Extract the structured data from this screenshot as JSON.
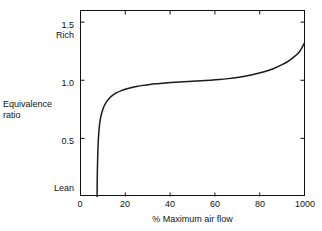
{
  "chart_data": {
    "type": "line",
    "title": "",
    "xlabel": "% Maximum air flow",
    "ylabel": "Equivalence ratio",
    "xlim": [
      0,
      100
    ],
    "ylim": [
      0,
      1.6
    ],
    "grid": false,
    "legend": null,
    "x_ticks": [
      {
        "value": 0,
        "label": "0"
      },
      {
        "value": 20,
        "label": "20"
      },
      {
        "value": 40,
        "label": "40"
      },
      {
        "value": 60,
        "label": "60"
      },
      {
        "value": 80,
        "label": "80"
      },
      {
        "value": 100,
        "label": "1000"
      }
    ],
    "y_ticks": [
      {
        "value": 0.5,
        "label": "0.5"
      },
      {
        "value": 1.0,
        "label": "1.0"
      },
      {
        "value": 1.5,
        "label": "1.5"
      }
    ],
    "annotations": [
      {
        "name": "rich",
        "text": "Rich",
        "at_y": 1.42
      },
      {
        "name": "lean",
        "text": "Lean",
        "at_y": 0.1
      }
    ],
    "series": [
      {
        "name": "equivalence-ratio-curve",
        "color": "#1a1a1a",
        "x": [
          7.4,
          7.5,
          7.7,
          8.0,
          8.4,
          8.9,
          9.5,
          10.2,
          11.0,
          12.0,
          13.2,
          14.6,
          16.2,
          18.0,
          20.0,
          22.5,
          25.0,
          28.0,
          31.0,
          34.0,
          38.0,
          42.0,
          46.0,
          50.0,
          54.0,
          58.0,
          62.0,
          66.0,
          70.0,
          74.0,
          78.0,
          82.0,
          86.0,
          90.0,
          93.0,
          96.0,
          98.0,
          100.0
        ],
        "y": [
          0.0,
          0.18,
          0.36,
          0.5,
          0.6,
          0.67,
          0.72,
          0.762,
          0.795,
          0.825,
          0.852,
          0.874,
          0.893,
          0.909,
          0.922,
          0.935,
          0.946,
          0.956,
          0.964,
          0.97,
          0.977,
          0.982,
          0.987,
          0.991,
          0.995,
          1.0,
          1.006,
          1.014,
          1.024,
          1.037,
          1.053,
          1.073,
          1.099,
          1.134,
          1.167,
          1.212,
          1.252,
          1.32
        ]
      }
    ]
  },
  "axes": {
    "y_label_line1": "Equivalence",
    "y_label_line2": "ratio",
    "x_label": "% Maximum air flow"
  },
  "notes": {
    "rich": "Rich",
    "lean": "Lean"
  },
  "ticks": {
    "y": [
      "1.5",
      "1.0",
      "0.5"
    ],
    "x": [
      "0",
      "20",
      "40",
      "60",
      "80",
      "1000"
    ]
  },
  "colors": {
    "curve": "#1a1a1a",
    "frame": "#111111",
    "background": "#ffffff"
  }
}
